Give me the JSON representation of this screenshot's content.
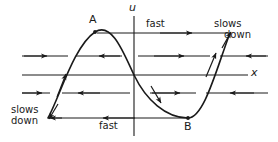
{
  "figure": {
    "type": "diagram",
    "width": 278,
    "height": 142,
    "background_color": "#ffffff",
    "stroke_color": "#1a1a1a",
    "axes": {
      "vertical": {
        "label": "u",
        "x": 134,
        "y_top": 16,
        "y_bottom": 136,
        "label_x": 130,
        "label_y": 4
      },
      "horizontal": {
        "label": "x",
        "y": 75,
        "x_left": 22,
        "x_right": 248,
        "label_x": 252,
        "label_y": 69
      }
    },
    "points": [
      {
        "name": "A",
        "label": "A",
        "x": 95,
        "y": 32,
        "label_x": 89,
        "label_y": 16
      },
      {
        "name": "B",
        "label": "B",
        "x": 188,
        "y": 118,
        "label_x": 184,
        "label_y": 122
      }
    ],
    "curve": {
      "name": "sinusoidal-velocity-curve",
      "description": "sine-like wave from lower-left through A, origin, B, to upper-right",
      "start": [
        48,
        118
      ],
      "peak": [
        95,
        32
      ],
      "zero_crossing": [
        134,
        75
      ],
      "trough": [
        188,
        118
      ],
      "end": [
        230,
        33
      ],
      "direction_arrows": [
        {
          "x": 64,
          "y": 78,
          "angle": -62
        },
        {
          "x": 160,
          "y": 98,
          "angle": 63
        },
        {
          "x": 213,
          "y": 56,
          "angle": -62
        }
      ]
    },
    "flow_lines": [
      {
        "name": "top-fast-line",
        "y": 33,
        "x_start": 97,
        "x_end": 228,
        "arrows": [
          {
            "x": 190,
            "dir": "right"
          }
        ]
      },
      {
        "name": "upper-mid-line-segment-left",
        "y": 56,
        "x_start": 22,
        "x_end": 68,
        "arrows": [
          {
            "x": 45,
            "dir": "right"
          }
        ]
      },
      {
        "name": "upper-mid-line-segment-inner-left",
        "y": 56,
        "x_start": 76,
        "x_end": 122,
        "arrows": [
          {
            "x": 100,
            "dir": "left"
          }
        ]
      },
      {
        "name": "upper-mid-line-segment-inner-right",
        "y": 56,
        "x_start": 138,
        "x_end": 210,
        "arrows": [
          {
            "x": 182,
            "dir": "right"
          }
        ]
      },
      {
        "name": "upper-mid-line-segment-right",
        "y": 56,
        "x_start": 220,
        "x_end": 268,
        "arrows": [
          {
            "x": 248,
            "dir": "left"
          }
        ]
      },
      {
        "name": "lower-mid-line-segment-left",
        "y": 93,
        "x_start": 22,
        "x_end": 50,
        "arrows": [
          {
            "x": 40,
            "dir": "right"
          }
        ]
      },
      {
        "name": "lower-mid-line-segment-inner-left",
        "y": 93,
        "x_start": 62,
        "x_end": 130,
        "arrows": [
          {
            "x": 80,
            "dir": "left"
          }
        ]
      },
      {
        "name": "lower-mid-line-segment-inner-right",
        "y": 93,
        "x_start": 150,
        "x_end": 196,
        "arrows": [
          {
            "x": 178,
            "dir": "right"
          }
        ]
      },
      {
        "name": "lower-mid-line-segment-right",
        "y": 93,
        "x_start": 206,
        "x_end": 268,
        "arrows": [
          {
            "x": 232,
            "dir": "left"
          }
        ]
      },
      {
        "name": "bottom-fast-line",
        "y": 118,
        "x_start": 48,
        "x_end": 188,
        "arrows": [
          {
            "x": 105,
            "dir": "left"
          }
        ]
      }
    ],
    "annotations": [
      {
        "name": "fast-top",
        "text": "fast",
        "x": 147,
        "y": 21,
        "style": "word"
      },
      {
        "name": "slows-down-top-right",
        "text": "slows\ndown",
        "line1": "slows",
        "line2": "down",
        "x": 214,
        "y": 20,
        "style": "slows",
        "indent_line2": 10
      },
      {
        "name": "slows-down-bottom-left",
        "text": "slows\ndown",
        "line1": "slows",
        "line2": "down",
        "x": 11,
        "y": 106,
        "style": "slows",
        "indent_line2": 0
      },
      {
        "name": "fast-bottom",
        "text": "fast",
        "x": 100,
        "y": 122,
        "style": "word"
      }
    ]
  }
}
